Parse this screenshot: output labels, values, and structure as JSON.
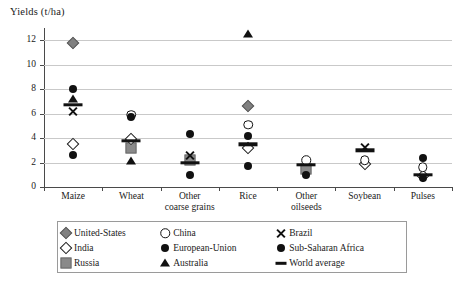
{
  "chart_data": {
    "type": "scatter",
    "title": "",
    "ylabel": "Yields (t/ha)",
    "xlabel": "",
    "ylim": [
      0,
      13
    ],
    "yticks": [
      0,
      2,
      4,
      6,
      8,
      10,
      12
    ],
    "ytick_labels": [
      "0",
      "2",
      "4",
      "6",
      "8",
      "10",
      "12"
    ],
    "grid": true,
    "legend_position": "below-plot",
    "categories": [
      "Maize",
      "Wheat",
      "Other coarse grains",
      "Rice",
      "Other oilseeds",
      "Soybean",
      "Pulses"
    ],
    "category_labels": [
      [
        "Maize"
      ],
      [
        "Wheat"
      ],
      [
        "Other",
        "coarse grains"
      ],
      [
        "Rice"
      ],
      [
        "Other",
        "oilseeds"
      ],
      [
        "Soybean"
      ],
      [
        "Pulses"
      ]
    ],
    "series": [
      {
        "name": "United-States",
        "marker": "diamond-filled",
        "values": [
          11.8,
          null,
          null,
          6.6,
          null,
          null,
          null
        ]
      },
      {
        "name": "India",
        "marker": "diamond-open",
        "values": [
          3.5,
          3.9,
          null,
          3.2,
          null,
          1.9,
          0.9
        ]
      },
      {
        "name": "Russia",
        "marker": "square",
        "values": [
          null,
          3.2,
          2.2,
          null,
          1.5,
          null,
          null
        ]
      },
      {
        "name": "China",
        "marker": "circle-open",
        "values": [
          null,
          5.9,
          null,
          5.1,
          2.2,
          2.2,
          1.6
        ]
      },
      {
        "name": "European-Union",
        "marker": "circle-filled",
        "values": [
          8.0,
          5.7,
          4.3,
          4.2,
          null,
          null,
          2.4
        ]
      },
      {
        "name": "Australia",
        "marker": "triangle",
        "values": [
          7.2,
          2.1,
          null,
          12.5,
          null,
          null,
          null
        ]
      },
      {
        "name": "Brazil",
        "marker": "x",
        "values": [
          6.2,
          null,
          2.6,
          null,
          null,
          3.2,
          null
        ]
      },
      {
        "name": "Sub-Saharan Africa",
        "marker": "circle-ssa",
        "values": [
          2.6,
          null,
          1.0,
          1.7,
          1.0,
          null,
          0.7
        ]
      },
      {
        "name": "World average",
        "marker": "bar",
        "values": [
          6.7,
          3.8,
          2.0,
          3.5,
          1.8,
          3.0,
          1.0
        ]
      }
    ]
  },
  "legend": {
    "entries": [
      {
        "label": "United-States",
        "marker": "diamond-filled"
      },
      {
        "label": "China",
        "marker": "circle-open"
      },
      {
        "label": "Brazil",
        "marker": "x"
      },
      {
        "label": "India",
        "marker": "diamond-open"
      },
      {
        "label": "European-Union",
        "marker": "circle-filled"
      },
      {
        "label": "Sub-Saharan Africa",
        "marker": "circle-ssa"
      },
      {
        "label": "Russia",
        "marker": "square"
      },
      {
        "label": "Australia",
        "marker": "triangle"
      },
      {
        "label": "World average",
        "marker": "bar"
      }
    ]
  },
  "colors": {
    "grid": "#c9c9c9",
    "axis": "#4a4a4a",
    "marker_dark": "#111111",
    "marker_gray": "#808080",
    "background": "#ffffff"
  }
}
